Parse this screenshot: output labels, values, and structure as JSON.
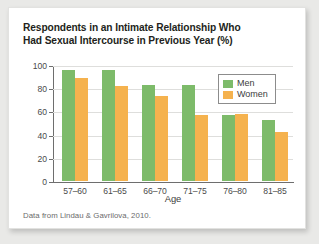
{
  "card": {
    "title_line1": "Respondents in an Intimate Relationship Who",
    "title_line2": "Had Sexual Intercourse in Previous Year (%)",
    "footnote": "Data from Lindau & Gavrilova, 2010."
  },
  "legend": {
    "position": "inside-top-right",
    "entries": [
      {
        "label": "Men",
        "color": "#7dbb6a",
        "swatch": "legend-swatch-men"
      },
      {
        "label": "Women",
        "color": "#f5b24e",
        "swatch": "legend-swatch-women"
      }
    ]
  },
  "chart_data": {
    "type": "bar",
    "title": "Respondents in an Intimate Relationship Who Had Sexual Intercourse in Previous Year (%)",
    "xlabel": "Age",
    "ylabel": "",
    "ylim": [
      0,
      100
    ],
    "yticks": [
      0,
      20,
      40,
      60,
      80,
      100
    ],
    "ytick_labels": [
      "0",
      "20",
      "40",
      "60",
      "80",
      "100"
    ],
    "grid": true,
    "grid_axis": "y",
    "categories": [
      "57–60",
      "61–65",
      "66–70",
      "71–75",
      "76–80",
      "81–85"
    ],
    "series": [
      {
        "name": "Men",
        "color": "#7dbb6a",
        "values": [
          96,
          96,
          83,
          83,
          57,
          53
        ]
      },
      {
        "name": "Women",
        "color": "#f5b24e",
        "values": [
          89,
          82,
          73,
          57,
          58,
          42
        ]
      }
    ],
    "units": "%",
    "source_note": "Data from Lindau & Gavrilova, 2010."
  }
}
